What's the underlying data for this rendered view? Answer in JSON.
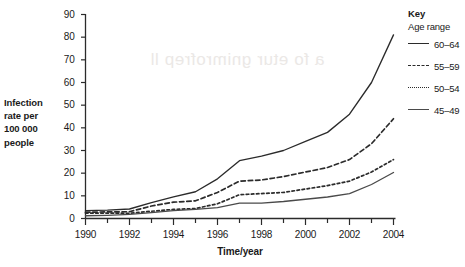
{
  "chart_data": {
    "type": "line",
    "title": "",
    "xlabel": "Time/year",
    "ylabel": "Infection rate per 100 000 people",
    "ylabel_lines": [
      "Infection",
      "rate per",
      "100 000",
      "people"
    ],
    "xlim": [
      1990,
      2004
    ],
    "ylim": [
      0,
      90
    ],
    "ytick_step": 10,
    "xtick_step": 2,
    "minor_xticks": true,
    "grid": false,
    "legend_position": "right",
    "legend_title": "Key",
    "legend_subtitle": "Age range",
    "yticks": [
      "0",
      "10",
      "20",
      "30",
      "40",
      "50",
      "60",
      "70",
      "80",
      "90"
    ],
    "xticks": [
      "1990",
      "1992",
      "1994",
      "1996",
      "1998",
      "2000",
      "2002",
      "2004"
    ],
    "x": [
      1990,
      1991,
      1992,
      1993,
      1994,
      1995,
      1996,
      1997,
      1998,
      1999,
      2000,
      2001,
      2002,
      2003,
      2004
    ],
    "series": [
      {
        "name": "60–64",
        "style": "solid",
        "color": "#2b2b2b",
        "values": [
          3.5,
          3.7,
          4.2,
          7.0,
          9.5,
          11.8,
          17.5,
          25.5,
          27.5,
          30.0,
          34.0,
          38.0,
          46.0,
          60.0,
          81.0
        ]
      },
      {
        "name": "55–59",
        "style": "dashed",
        "color": "#2b2b2b",
        "values": [
          2.8,
          2.9,
          3.0,
          5.5,
          7.2,
          7.8,
          11.5,
          16.5,
          17.0,
          18.5,
          20.5,
          22.5,
          26.0,
          33.0,
          44.0
        ]
      },
      {
        "name": "50–54",
        "style": "dotted",
        "color": "#2b2b2b",
        "values": [
          2.4,
          2.4,
          2.3,
          3.2,
          4.0,
          4.4,
          6.5,
          10.5,
          11.0,
          11.5,
          13.0,
          14.5,
          16.5,
          20.5,
          26.0
        ]
      },
      {
        "name": "45–49",
        "style": "solid",
        "color": "#4a4a4a",
        "values": [
          1.2,
          1.4,
          1.8,
          2.6,
          3.5,
          4.0,
          4.8,
          6.8,
          6.8,
          7.5,
          8.5,
          9.5,
          11.0,
          15.0,
          20.3
        ]
      }
    ]
  },
  "ghost": {
    "text": "a fo etur gnimrofrep ll"
  }
}
